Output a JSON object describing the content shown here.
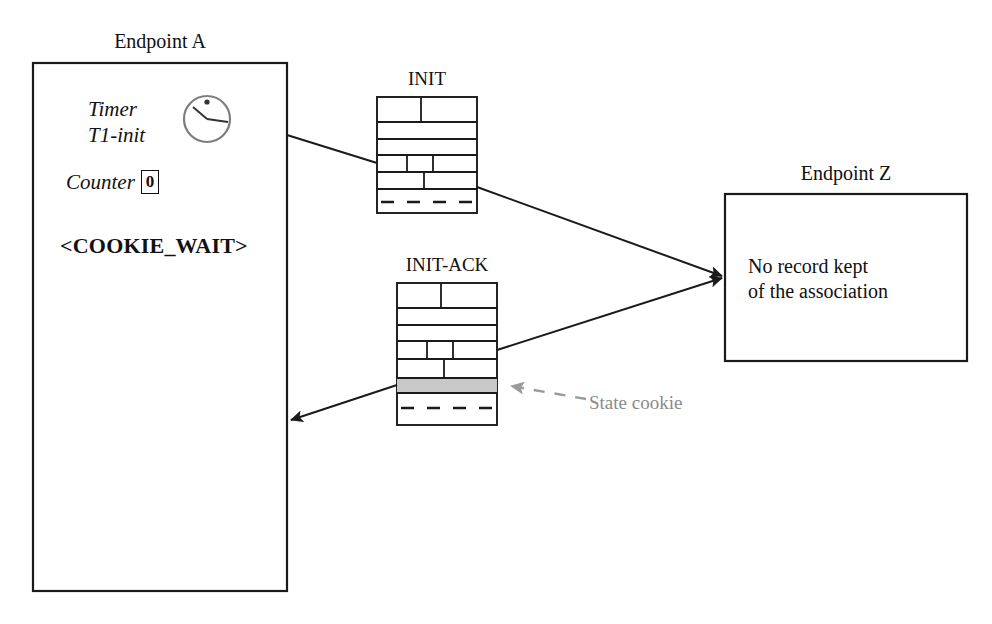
{
  "diagram": {
    "colors": {
      "stroke": "#1a1a1a",
      "background": "#ffffff",
      "cookie_fill": "#c8c8c8",
      "annotation_gray": "#8a8a8a",
      "clock_gray": "#7d7d7d"
    }
  },
  "endpoint_a": {
    "title": "Endpoint A",
    "timer_line1": "Timer",
    "timer_line2": "T1-init",
    "counter_label": "Counter",
    "counter_value": "0",
    "state": "<COOKIE_WAIT>",
    "clock_icon": "clock-icon"
  },
  "endpoint_z": {
    "title": "Endpoint Z",
    "body_line1": "No record kept",
    "body_line2": "of the association"
  },
  "packets": [
    {
      "id": "init",
      "title": "INIT",
      "rows": 7,
      "has_cookie_row": false,
      "dashed_row_index": 6
    },
    {
      "id": "init-ack",
      "title": "INIT-ACK",
      "rows": 8,
      "has_cookie_row": true,
      "cookie_row_index": 6,
      "dashed_row_index": 7
    }
  ],
  "annotations": {
    "state_cookie": "State cookie"
  },
  "arrows": [
    {
      "id": "a-to-init",
      "from": "endpoint-a",
      "to": "init-packet",
      "arrowhead": false
    },
    {
      "id": "init-to-z",
      "from": "init-packet",
      "to": "endpoint-z",
      "arrowhead": true
    },
    {
      "id": "z-to-initack",
      "from": "endpoint-z",
      "to": "init-ack-packet",
      "arrowhead": true
    },
    {
      "id": "initack-to-a",
      "from": "init-ack-packet",
      "to": "endpoint-a",
      "arrowhead": true
    },
    {
      "id": "cookie-leader",
      "from": "state-cookie-label",
      "to": "cookie-row",
      "arrowhead": true,
      "style": "dashed-gray"
    }
  ]
}
